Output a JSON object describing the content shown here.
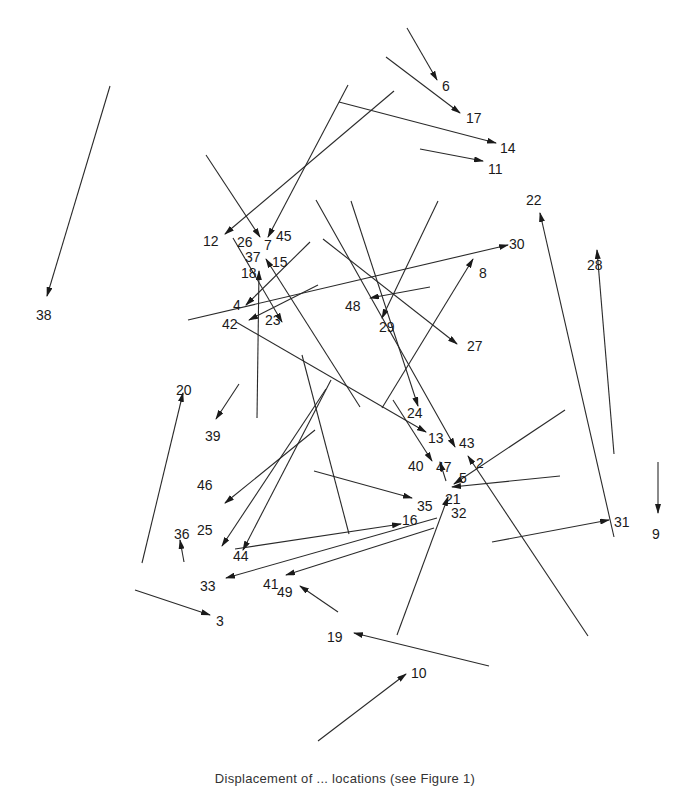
{
  "figure": {
    "caption": "Displacement of ... locations (see Figure 1)",
    "stroke_color": "#2a2a2a",
    "label_color": "#1a1a1a",
    "background": "#ffffff"
  },
  "vectors": [
    {
      "id": "6",
      "from": [
        407,
        28
      ],
      "to": [
        437,
        80
      ],
      "label": [
        442,
        86
      ]
    },
    {
      "id": "17",
      "from": [
        386,
        57
      ],
      "to": [
        460,
        113
      ],
      "label": [
        466,
        118
      ]
    },
    {
      "id": "14",
      "from": [
        339,
        102
      ],
      "to": [
        496,
        143
      ],
      "label": [
        500,
        148
      ]
    },
    {
      "id": "11",
      "from": [
        420,
        149
      ],
      "to": [
        483,
        161
      ],
      "label": [
        488,
        169
      ]
    },
    {
      "id": "38",
      "from": [
        110,
        86
      ],
      "to": [
        47,
        296
      ],
      "label": [
        36,
        315
      ]
    },
    {
      "id": "12",
      "from": [
        394,
        91
      ],
      "to": [
        225,
        234
      ],
      "label": [
        203,
        241
      ]
    },
    {
      "id": "26",
      "from": [
        206,
        155
      ],
      "to": [
        260,
        237
      ],
      "label": [
        237,
        242
      ]
    },
    {
      "id": "45",
      "from": [
        348,
        85
      ],
      "to": [
        268,
        237
      ],
      "label": [
        276,
        236
      ]
    },
    {
      "id": "7",
      "from": [
        0,
        0
      ],
      "to": [
        0,
        0
      ],
      "label": [
        264,
        245
      ],
      "no_line": true
    },
    {
      "id": "37",
      "from": [
        0,
        0
      ],
      "to": [
        0,
        0
      ],
      "label": [
        245,
        257
      ],
      "no_line": true
    },
    {
      "id": "15",
      "from": [
        360,
        407
      ],
      "to": [
        266,
        259
      ],
      "label": [
        272,
        262
      ]
    },
    {
      "id": "18",
      "from": [
        257,
        418
      ],
      "to": [
        259,
        271
      ],
      "label": [
        241,
        273
      ]
    },
    {
      "id": "4",
      "from": [
        310,
        242
      ],
      "to": [
        246,
        305
      ],
      "label": [
        233,
        305
      ]
    },
    {
      "id": "42",
      "from": [
        318,
        285
      ],
      "to": [
        249,
        320
      ],
      "label": [
        222,
        324
      ]
    },
    {
      "id": "23",
      "from": [
        233,
        238
      ],
      "to": [
        282,
        322
      ],
      "label": [
        265,
        320
      ]
    },
    {
      "id": "30",
      "from": [
        188,
        320
      ],
      "to": [
        508,
        245
      ],
      "label": [
        509,
        244
      ]
    },
    {
      "id": "8",
      "from": [
        382,
        408
      ],
      "to": [
        473,
        259
      ],
      "label": [
        479,
        273
      ]
    },
    {
      "id": "48",
      "from": [
        430,
        287
      ],
      "to": [
        370,
        298
      ],
      "label": [
        345,
        306
      ]
    },
    {
      "id": "29",
      "from": [
        438,
        201
      ],
      "to": [
        382,
        318
      ],
      "label": [
        379,
        327
      ]
    },
    {
      "id": "27",
      "from": [
        323,
        239
      ],
      "to": [
        457,
        344
      ],
      "label": [
        467,
        346
      ]
    },
    {
      "id": "24",
      "from": [
        351,
        201
      ],
      "to": [
        418,
        406
      ],
      "label": [
        407,
        413
      ]
    },
    {
      "id": "13",
      "from": [
        236,
        322
      ],
      "to": [
        426,
        432
      ],
      "label": [
        428,
        438
      ]
    },
    {
      "id": "43",
      "from": [
        316,
        200
      ],
      "to": [
        455,
        447
      ],
      "label": [
        459,
        443
      ]
    },
    {
      "id": "40",
      "from": [
        393,
        400
      ],
      "to": [
        432,
        461
      ],
      "label": [
        408,
        466
      ]
    },
    {
      "id": "47",
      "from": [
        446,
        481
      ],
      "to": [
        440,
        462
      ],
      "label": [
        436,
        467
      ]
    },
    {
      "id": "2",
      "from": [
        588,
        636
      ],
      "to": [
        468,
        456
      ],
      "label": [
        476,
        463
      ]
    },
    {
      "id": "5",
      "from": [
        565,
        410
      ],
      "to": [
        454,
        484
      ],
      "label": [
        459,
        478
      ]
    },
    {
      "id": "21",
      "from": [
        560,
        476
      ],
      "to": [
        452,
        487
      ],
      "label": [
        445,
        499
      ]
    },
    {
      "id": "35",
      "from": [
        314,
        471
      ],
      "to": [
        412,
        498
      ],
      "label": [
        417,
        506
      ]
    },
    {
      "id": "32",
      "from": [
        397,
        635
      ],
      "to": [
        448,
        497
      ],
      "label": [
        451,
        513
      ]
    },
    {
      "id": "16",
      "from": [
        235,
        549
      ],
      "to": [
        401,
        524
      ],
      "label": [
        402,
        520
      ]
    },
    {
      "id": "22",
      "from": [
        614,
        537
      ],
      "to": [
        540,
        213
      ],
      "label": [
        526,
        200
      ]
    },
    {
      "id": "28",
      "from": [
        614,
        454
      ],
      "to": [
        597,
        250
      ],
      "label": [
        587,
        265
      ]
    },
    {
      "id": "31",
      "from": [
        492,
        542
      ],
      "to": [
        609,
        520
      ],
      "label": [
        614,
        522
      ]
    },
    {
      "id": "9",
      "from": [
        658,
        462
      ],
      "to": [
        658,
        513
      ],
      "label": [
        652,
        534
      ]
    },
    {
      "id": "20",
      "from": [
        142,
        563
      ],
      "to": [
        183,
        393
      ],
      "label": [
        176,
        390
      ]
    },
    {
      "id": "39",
      "from": [
        239,
        384
      ],
      "to": [
        216,
        419
      ],
      "label": [
        205,
        436
      ]
    },
    {
      "id": "46",
      "from": [
        315,
        430
      ],
      "to": [
        225,
        503
      ],
      "label": [
        197,
        485
      ]
    },
    {
      "id": "25",
      "from": [
        326,
        389
      ],
      "to": [
        222,
        546
      ],
      "label": [
        197,
        530
      ]
    },
    {
      "id": "44",
      "from": [
        331,
        380
      ],
      "to": [
        243,
        550
      ],
      "label": [
        233,
        556
      ]
    },
    {
      "id": "36",
      "from": [
        184,
        562
      ],
      "to": [
        180,
        540
      ],
      "label": [
        174,
        534
      ]
    },
    {
      "id": "33",
      "from": [
        437,
        518
      ],
      "to": [
        226,
        578
      ],
      "label": [
        200,
        586
      ]
    },
    {
      "id": "41",
      "from": [
        434,
        528
      ],
      "to": [
        286,
        575
      ],
      "label": [
        263,
        584
      ]
    },
    {
      "id": "49",
      "from": [
        338,
        612
      ],
      "to": [
        300,
        586
      ],
      "label": [
        277,
        592
      ]
    },
    {
      "id": "3",
      "from": [
        135,
        590
      ],
      "to": [
        210,
        615
      ],
      "label": [
        216,
        621
      ]
    },
    {
      "id": "19",
      "from": [
        489,
        666
      ],
      "to": [
        354,
        633
      ],
      "label": [
        327,
        637
      ]
    },
    {
      "id": "10",
      "from": [
        318,
        741
      ],
      "to": [
        406,
        674
      ],
      "label": [
        411,
        673
      ]
    },
    {
      "id": "34",
      "from": [
        349,
        534
      ],
      "to": [
        302,
        355
      ],
      "label": [
        0,
        0
      ],
      "no_label": true,
      "no_arrow": true
    }
  ]
}
